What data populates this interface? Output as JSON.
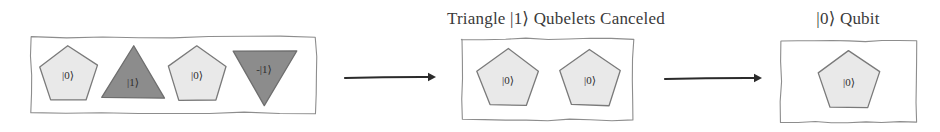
{
  "canvas": {
    "width": 940,
    "height": 132,
    "background": "#ffffff"
  },
  "palette": {
    "box_stroke": "#8d8d8d",
    "pentagon_fill": "#e9e9e9",
    "pentagon_stroke": "#7a7a7a",
    "triangle_fill": "#8c8c8c",
    "triangle_stroke": "#6e6e6e",
    "arrow_color": "#2b2b2b",
    "label_color": "#3a3a3a",
    "shape_text_color": "#2c2c2c"
  },
  "labels": {
    "middle_group": "Triangle |1⟩ Qubelets Canceled",
    "right_group": "|0⟩ Qubit"
  },
  "groups": [
    {
      "id": "left-group",
      "name": "initial-qubelet-group",
      "label": "",
      "box": {
        "x": 31,
        "y": 37,
        "width": 285,
        "height": 76
      },
      "shapes": [
        {
          "id": "s1",
          "kind": "pentagon",
          "name": "pentagon-qubelet-ket0-1",
          "label": "|0⟩",
          "cx": 68,
          "cy": 75,
          "r": 31
        },
        {
          "id": "s2",
          "kind": "triangle-up",
          "name": "triangle-qubelet-ket1",
          "label": "|1⟩",
          "cx": 133,
          "cy": 75,
          "r": 31
        },
        {
          "id": "s3",
          "kind": "pentagon",
          "name": "pentagon-qubelet-ket0-2",
          "label": "|0⟩",
          "cx": 197,
          "cy": 75,
          "r": 31
        },
        {
          "id": "s4",
          "kind": "triangle-down",
          "name": "triangle-qubelet-minus-ket1",
          "label": "-|1⟩",
          "cx": 264,
          "cy": 75,
          "r": 31
        }
      ]
    },
    {
      "id": "middle-group",
      "name": "canceled-qubelet-group",
      "label": "Triangle |1⟩ Qubelets Canceled",
      "label_box": {
        "x": 401,
        "y": 8,
        "width": 310
      },
      "box": {
        "x": 462,
        "y": 39,
        "width": 171,
        "height": 81
      },
      "shapes": [
        {
          "id": "m1",
          "kind": "pentagon",
          "name": "pentagon-qubelet-ket0-3",
          "label": "|0⟩",
          "cx": 508,
          "cy": 80,
          "r": 32
        },
        {
          "id": "m2",
          "kind": "pentagon",
          "name": "pentagon-qubelet-ket0-4",
          "label": "|0⟩",
          "cx": 590,
          "cy": 80,
          "r": 32
        }
      ]
    },
    {
      "id": "right-group",
      "name": "resulting-qubit-group",
      "label": "|0⟩ Qubit",
      "label_box": {
        "x": 778,
        "y": 8,
        "width": 140
      },
      "box": {
        "x": 781,
        "y": 41,
        "width": 135,
        "height": 81
      },
      "shapes": [
        {
          "id": "r1",
          "kind": "pentagon",
          "name": "pentagon-qubit-ket0",
          "label": "|0⟩",
          "cx": 849,
          "cy": 82,
          "r": 33
        }
      ]
    }
  ],
  "arrows": [
    {
      "id": "a1",
      "name": "arrow-left-to-middle",
      "x1": 345,
      "y1": 78,
      "x2": 435,
      "y2": 77
    },
    {
      "id": "a2",
      "name": "arrow-middle-to-right",
      "x1": 665,
      "y1": 79,
      "x2": 761,
      "y2": 78
    }
  ]
}
